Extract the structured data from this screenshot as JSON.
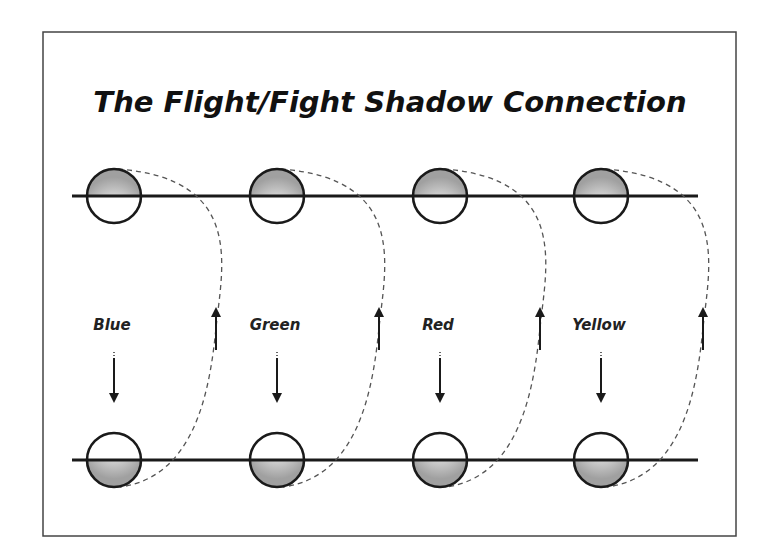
{
  "diagram": {
    "title": "The Flight/Fight Shadow Connection",
    "colors": {
      "stroke": "#1a1a1a",
      "frame": "#444444",
      "dashed": "#555555",
      "shade_light": "#f4f4f4",
      "shade_dark": "#a8a8a8"
    },
    "lines": {
      "top_y": 196,
      "bottom_y": 460,
      "x_start": 72,
      "x_end": 698
    },
    "stages": [
      {
        "label": "Blue",
        "cx": 114,
        "up_arrow_x": 216
      },
      {
        "label": "Green",
        "cx": 277,
        "up_arrow_x": 379
      },
      {
        "label": "Red",
        "cx": 440,
        "up_arrow_x": 540
      },
      {
        "label": "Yellow",
        "cx": 601,
        "up_arrow_x": 703
      }
    ],
    "circle_radius": 27,
    "top_circle_shading": "upper-half",
    "bottom_circle_shading": "lower-half",
    "down_arrow_direction": "down",
    "up_arrow_direction": "up"
  }
}
